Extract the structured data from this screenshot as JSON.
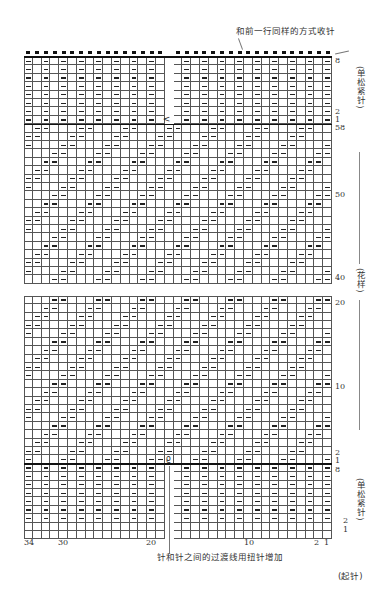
{
  "annotations": {
    "top_note": "和前一行同样的方式收针",
    "bottom_note": "针和针之间的过渡线用扭针增加",
    "rib_label_top": "(单松紧针)",
    "pattern_label": "(花样)",
    "rib_label_bottom": "(单松紧针)",
    "cast_on_label": "(起针)"
  },
  "row_labels": {
    "top_rib": [
      "8",
      "2",
      "1"
    ],
    "pattern_top": [
      "58",
      "50",
      "40"
    ],
    "pattern_bottom": [
      "20",
      "10",
      "2",
      "1"
    ],
    "bottom_rib": [
      "8",
      "2",
      "1"
    ]
  },
  "column_labels": [
    "34",
    "30",
    "20",
    "10",
    "2",
    "1"
  ],
  "symbols": {
    "purl": "—",
    "decrease": "<",
    "twisted_increase": "ϱ",
    "bind_off": "■"
  },
  "chart": {
    "stitch_count": 34,
    "pattern_period": 5,
    "colors": {
      "grid": "#555555",
      "ink": "#222222",
      "background": "#ffffff"
    }
  }
}
